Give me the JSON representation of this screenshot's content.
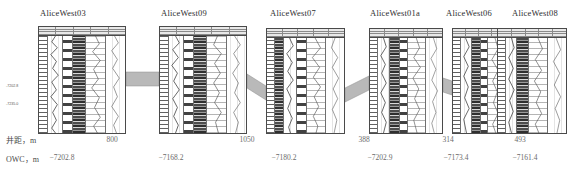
{
  "figure": {
    "type": "well-log-correlation-cross-section",
    "well_count": 6
  },
  "wells": [
    {
      "name": "AliceWest03",
      "title_x": 34,
      "panel_x": 38,
      "panel_w": 88
    },
    {
      "name": "AliceWest09",
      "title_x": 155,
      "panel_x": 159,
      "panel_w": 88
    },
    {
      "name": "AliceWest07",
      "title_x": 272,
      "panel_x": 266,
      "panel_w": 79
    },
    {
      "name": "AliceWest01a",
      "title_x": 372,
      "panel_x": 369,
      "panel_w": 74
    },
    {
      "name": "AliceWest06",
      "title_x": 455,
      "panel_x": 452,
      "panel_w": 66
    },
    {
      "name": "AliceWest08",
      "title_x": 531,
      "panel_x": 497,
      "panel_w": 70
    }
  ],
  "tracks": [
    {
      "kind": "scale"
    },
    {
      "kind": "curve"
    },
    {
      "kind": "dark"
    },
    {
      "kind": "block"
    },
    {
      "kind": "light"
    },
    {
      "kind": "curve2"
    }
  ],
  "rows": {
    "spacing": {
      "label": "井距，m",
      "values": [
        "800",
        "1050",
        "388",
        "314",
        "493"
      ],
      "value_x": [
        112,
        247,
        364,
        448,
        520
      ]
    },
    "owc": {
      "label": "OWC，m",
      "values": [
        "−7202.8",
        "−7168.2",
        "−7180.2",
        "−7202.9",
        "−7173.4",
        "−7161.4"
      ],
      "value_x": [
        58,
        170,
        283,
        379,
        455,
        524
      ]
    }
  },
  "depth_tags": [
    {
      "text": "-7202.8",
      "x": 6,
      "y": 85
    },
    {
      "text": "-7235.0",
      "x": 6,
      "y": 103
    }
  ],
  "colors": {
    "band_fill": "#b9b9b9",
    "band_stroke": "#8d8d8d",
    "panel_border": "#4a4a4a",
    "text": "#3a3a3a",
    "value_text": "#6b6b6b",
    "track_dark": "#2f2f2f",
    "background": "#ffffff"
  }
}
